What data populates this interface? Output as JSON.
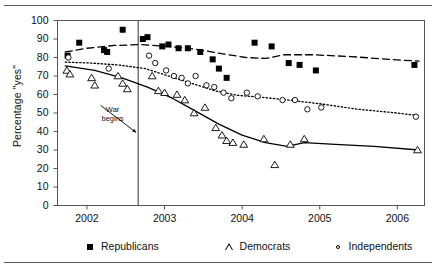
{
  "figure": {
    "has_top_rule": true,
    "has_bottom_rule": true,
    "background": "#ffffff",
    "ink": "#000000"
  },
  "chart_data": {
    "type": "scatter",
    "title": "",
    "subtitle": "",
    "xlabel": "",
    "ylabel": "Percentage \"yes\"",
    "xlim": [
      2001.62,
      2006.35
    ],
    "ylim": [
      0,
      100
    ],
    "grid": false,
    "legend_position": "below-axes",
    "x_ticks": [
      2002,
      2003,
      2004,
      2005,
      2006
    ],
    "x_tick_labels": [
      "2002",
      "2003",
      "2004",
      "2005",
      "2006"
    ],
    "y_ticks": [
      0,
      10,
      20,
      30,
      40,
      50,
      60,
      70,
      80,
      90,
      100
    ],
    "y_tick_labels": [
      "0",
      "10",
      "20",
      "30",
      "40",
      "50",
      "60",
      "70",
      "80",
      "90",
      "100"
    ],
    "annotations": [
      {
        "text": "War\nbegins",
        "x": 2002.33,
        "y": 49,
        "arrow_to_x": 2002.66,
        "arrow_to_y": 40,
        "name": "war-begins-annotation"
      }
    ],
    "vertical_rules": [
      {
        "x": 2002.66,
        "name": "war-begins-line",
        "color": "#555555"
      }
    ],
    "series": [
      {
        "name": "Republicans",
        "marker": "filled-square",
        "line_style": "dashed",
        "color": "#000000",
        "points": [
          [
            2001.75,
            81
          ],
          [
            2001.9,
            88
          ],
          [
            2002.22,
            84
          ],
          [
            2002.26,
            83
          ],
          [
            2002.46,
            95
          ],
          [
            2002.72,
            90
          ],
          [
            2002.78,
            91
          ],
          [
            2002.97,
            86
          ],
          [
            2003.05,
            87
          ],
          [
            2003.18,
            85
          ],
          [
            2003.3,
            85
          ],
          [
            2003.46,
            83
          ],
          [
            2003.62,
            79
          ],
          [
            2003.7,
            74
          ],
          [
            2003.8,
            69
          ],
          [
            2004.16,
            88
          ],
          [
            2004.38,
            86
          ],
          [
            2004.6,
            77
          ],
          [
            2004.74,
            76
          ],
          [
            2004.95,
            73
          ],
          [
            2006.22,
            76
          ]
        ],
        "trend": [
          [
            2001.72,
            83
          ],
          [
            2002.0,
            85
          ],
          [
            2002.35,
            86.5
          ],
          [
            2002.7,
            87
          ],
          [
            2003.05,
            86
          ],
          [
            2003.4,
            84.5
          ],
          [
            2003.75,
            82
          ],
          [
            2004.05,
            80
          ],
          [
            2004.3,
            79.5
          ],
          [
            2004.55,
            81.5
          ],
          [
            2004.9,
            81.5
          ],
          [
            2005.4,
            80.5
          ],
          [
            2005.9,
            79
          ],
          [
            2006.28,
            78
          ]
        ]
      },
      {
        "name": "Democrats",
        "marker": "open-triangle",
        "line_style": "solid",
        "color": "#000000",
        "points": [
          [
            2001.74,
            73
          ],
          [
            2001.78,
            71
          ],
          [
            2002.06,
            69
          ],
          [
            2002.1,
            65
          ],
          [
            2002.4,
            70
          ],
          [
            2002.46,
            66
          ],
          [
            2002.52,
            63
          ],
          [
            2002.84,
            70
          ],
          [
            2002.92,
            62
          ],
          [
            2003.0,
            61
          ],
          [
            2003.16,
            60
          ],
          [
            2003.26,
            57
          ],
          [
            2003.38,
            50
          ],
          [
            2003.52,
            53
          ],
          [
            2003.66,
            42
          ],
          [
            2003.74,
            38
          ],
          [
            2003.8,
            35
          ],
          [
            2003.88,
            34
          ],
          [
            2004.02,
            33
          ],
          [
            2004.28,
            36
          ],
          [
            2004.42,
            22
          ],
          [
            2004.62,
            33
          ],
          [
            2004.8,
            36
          ],
          [
            2006.26,
            30
          ]
        ],
        "trend": [
          [
            2001.72,
            75.5
          ],
          [
            2002.1,
            73
          ],
          [
            2002.45,
            69
          ],
          [
            2002.78,
            64
          ],
          [
            2003.1,
            58
          ],
          [
            2003.4,
            51
          ],
          [
            2003.7,
            44
          ],
          [
            2004.0,
            38
          ],
          [
            2004.3,
            34
          ],
          [
            2004.58,
            32
          ],
          [
            2004.8,
            34
          ],
          [
            2005.2,
            33
          ],
          [
            2005.7,
            32
          ],
          [
            2006.28,
            30
          ]
        ]
      },
      {
        "name": "Independents",
        "marker": "open-circle",
        "line_style": "dotted",
        "color": "#000000",
        "points": [
          [
            2001.76,
            80
          ],
          [
            2002.28,
            74
          ],
          [
            2002.8,
            81
          ],
          [
            2002.88,
            77
          ],
          [
            2003.02,
            73
          ],
          [
            2003.12,
            70
          ],
          [
            2003.22,
            69
          ],
          [
            2003.3,
            66
          ],
          [
            2003.4,
            70
          ],
          [
            2003.54,
            65
          ],
          [
            2003.64,
            64
          ],
          [
            2003.76,
            61
          ],
          [
            2003.86,
            58
          ],
          [
            2004.06,
            61
          ],
          [
            2004.2,
            59
          ],
          [
            2004.52,
            57
          ],
          [
            2004.68,
            57
          ],
          [
            2004.84,
            52
          ],
          [
            2005.02,
            53
          ],
          [
            2006.24,
            48
          ]
        ],
        "trend": [
          [
            2001.72,
            77.5
          ],
          [
            2002.05,
            77
          ],
          [
            2002.4,
            76
          ],
          [
            2002.75,
            74
          ],
          [
            2003.05,
            70
          ],
          [
            2003.35,
            66
          ],
          [
            2003.65,
            62
          ],
          [
            2003.95,
            59.5
          ],
          [
            2004.25,
            58.5
          ],
          [
            2004.6,
            57
          ],
          [
            2005.0,
            55
          ],
          [
            2005.5,
            52
          ],
          [
            2006.0,
            50
          ],
          [
            2006.28,
            48.5
          ]
        ]
      }
    ]
  },
  "legend": {
    "entries": [
      {
        "label": "Republicans",
        "marker": "filled-square"
      },
      {
        "label": "Democrats",
        "marker": "open-triangle"
      },
      {
        "label": "Independents",
        "marker": "open-circle"
      }
    ]
  }
}
